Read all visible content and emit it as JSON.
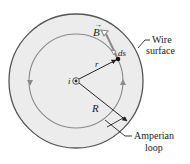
{
  "diagram": {
    "type": "amperian-loop-inside-wire",
    "labels": {
      "field_vector": "B",
      "path_element": "ds",
      "current": "i",
      "loop_radius": "r",
      "wire_radius": "R",
      "wire_surface_line1": "Wire",
      "wire_surface_line2": "surface",
      "amperian_line1": "Amperian",
      "amperian_line2": "loop"
    },
    "colors": {
      "wire_fill": "#ececec",
      "outline": "#555555",
      "loop": "#8a8a8a",
      "vector": "#8a8a8a",
      "text": "#222222"
    }
  }
}
